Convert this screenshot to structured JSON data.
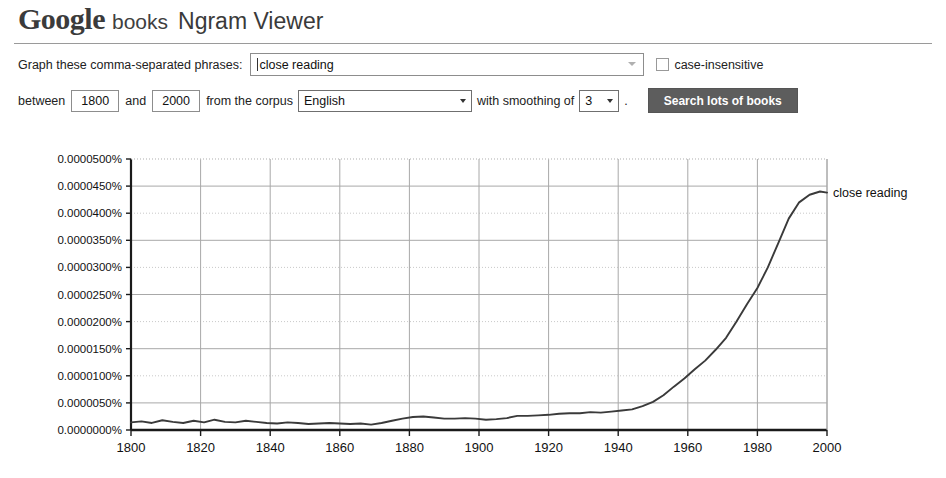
{
  "header": {
    "logo_google": "Google",
    "logo_books": "books",
    "logo_ngram": "Ngram Viewer"
  },
  "form": {
    "phrases_label": "Graph these comma-separated phrases:",
    "phrases_value": "close reading",
    "phrases_placeholder": "close reading",
    "case_insensitive_label": "case-insensitive",
    "case_insensitive_checked": false,
    "between_label": "between",
    "start_year": "1800",
    "and_label": "and",
    "end_year": "2000",
    "corpus_label": "from the corpus",
    "corpus_value": "English",
    "smoothing_label": "with smoothing of",
    "smoothing_value": "3",
    "period_label": ".",
    "search_button_label": "Search lots of books"
  },
  "colors": {
    "button_bg": "#5d5d5d",
    "line": "#3a3a3a",
    "grid_major": "#a8a8a8",
    "grid_minor": "#c9c9c9",
    "axis": "#1a1a1a"
  },
  "chart_data": {
    "type": "line",
    "title": "",
    "xlabel": "",
    "ylabel": "",
    "xlim": [
      1800,
      2000
    ],
    "ylim": [
      0.0,
      5e-05
    ],
    "grid": true,
    "legend_position": "right-of-line-end",
    "ytick_labels": [
      "0.0000500%",
      "0.0000450%",
      "0.0000400%",
      "0.0000350%",
      "0.0000300%",
      "0.0000250%",
      "0.0000200%",
      "0.0000150%",
      "0.0000100%",
      "0.0000050%",
      "0.0000000%"
    ],
    "ytick_values": [
      5e-05,
      4.5e-05,
      4e-05,
      3.5e-05,
      3e-05,
      2.5e-05,
      2e-05,
      1.5e-05,
      1e-05,
      5e-06,
      0.0
    ],
    "xtick_labels": [
      "1800",
      "1820",
      "1840",
      "1860",
      "1880",
      "1900",
      "1920",
      "1940",
      "1960",
      "1980",
      "2000"
    ],
    "xtick_values": [
      1800,
      1820,
      1840,
      1860,
      1880,
      1900,
      1920,
      1940,
      1960,
      1980,
      2000
    ],
    "series": [
      {
        "name": "close reading",
        "color": "#3a3a3a",
        "x": [
          1800,
          1803,
          1806,
          1809,
          1812,
          1815,
          1818,
          1821,
          1824,
          1827,
          1830,
          1833,
          1836,
          1839,
          1842,
          1845,
          1848,
          1851,
          1854,
          1857,
          1860,
          1863,
          1866,
          1869,
          1872,
          1875,
          1878,
          1881,
          1884,
          1887,
          1890,
          1893,
          1896,
          1899,
          1902,
          1905,
          1908,
          1911,
          1914,
          1917,
          1920,
          1923,
          1926,
          1929,
          1932,
          1935,
          1938,
          1941,
          1944,
          1947,
          1950,
          1953,
          1956,
          1959,
          1962,
          1965,
          1968,
          1971,
          1974,
          1977,
          1980,
          1983,
          1986,
          1989,
          1992,
          1995,
          1998,
          2000
        ],
        "values": [
          1.4e-06,
          1.6e-06,
          1.3e-06,
          1.8e-06,
          1.5e-06,
          1.3e-06,
          1.7e-06,
          1.4e-06,
          1.9e-06,
          1.5e-06,
          1.4e-06,
          1.7e-06,
          1.5e-06,
          1.3e-06,
          1.2e-06,
          1.4e-06,
          1.3e-06,
          1.1e-06,
          1.2e-06,
          1.3e-06,
          1.2e-06,
          1.1e-06,
          1.2e-06,
          1e-06,
          1.3e-06,
          1.7e-06,
          2.1e-06,
          2.4e-06,
          2.5e-06,
          2.3e-06,
          2.1e-06,
          2.1e-06,
          2.2e-06,
          2.1e-06,
          1.9e-06,
          2e-06,
          2.2e-06,
          2.6e-06,
          2.6e-06,
          2.7e-06,
          2.8e-06,
          3e-06,
          3.1e-06,
          3.1e-06,
          3.3e-06,
          3.2e-06,
          3.4e-06,
          3.6e-06,
          3.8e-06,
          4.4e-06,
          5.2e-06,
          6.4e-06,
          8e-06,
          9.5e-06,
          1.12e-05,
          1.28e-05,
          1.48e-05,
          1.7e-05,
          2e-05,
          2.32e-05,
          2.62e-05,
          3e-05,
          3.45e-05,
          3.9e-05,
          4.2e-05,
          4.34e-05,
          4.4e-05,
          4.38e-05
        ]
      }
    ]
  }
}
